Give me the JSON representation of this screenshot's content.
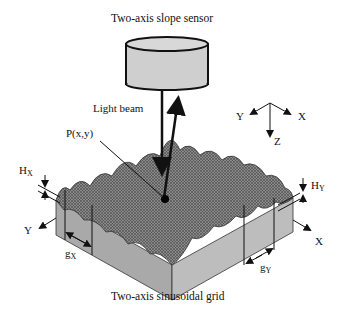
{
  "diagram": {
    "sensor_label": "Two-axis slope sensor",
    "beam_label": "Light beam",
    "point_label": "P(x,y)",
    "grid_label": "Two-axis sinusoidal grid",
    "axes_3d": {
      "y": "Y",
      "x": "X",
      "z": "Z"
    },
    "height_x": {
      "main": "H",
      "sub": "X"
    },
    "height_y": {
      "main": "H",
      "sub": "Y"
    },
    "pitch_x": {
      "main": "g",
      "sub": "X"
    },
    "pitch_y": {
      "main": "g",
      "sub": "Y"
    },
    "block_axis_y": "Y",
    "block_axis_x": "X"
  }
}
